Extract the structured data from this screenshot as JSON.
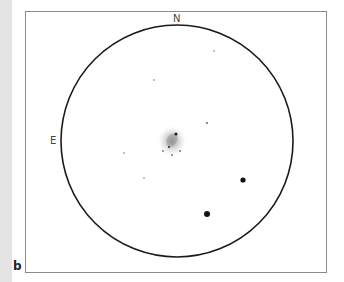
{
  "figure": {
    "panel_label": "b",
    "directions": {
      "north": "N",
      "east": "E"
    },
    "field_of_view": {
      "center_x": 177,
      "center_y": 141,
      "radius": 116,
      "stroke_color": "#1a1a1a"
    },
    "central_object": {
      "type": "nebulous-patch",
      "x": 172,
      "y": 140,
      "color": "#9a9a9a",
      "embedded_stars": [
        {
          "x": 176,
          "y": 134,
          "r": 1.6
        },
        {
          "x": 169,
          "y": 147,
          "r": 1.0
        },
        {
          "x": 163,
          "y": 151,
          "r": 0.8
        },
        {
          "x": 172,
          "y": 155,
          "r": 0.8
        },
        {
          "x": 180,
          "y": 151,
          "r": 0.8
        }
      ]
    },
    "stars": [
      {
        "x": 214,
        "y": 51,
        "r": 0.7,
        "brightness": "faint"
      },
      {
        "x": 154,
        "y": 80,
        "r": 0.7,
        "brightness": "faint"
      },
      {
        "x": 207,
        "y": 123,
        "r": 0.9,
        "brightness": "faint"
      },
      {
        "x": 124,
        "y": 153,
        "r": 0.7,
        "brightness": "faint"
      },
      {
        "x": 144,
        "y": 178,
        "r": 0.7,
        "brightness": "faint"
      },
      {
        "x": 243,
        "y": 180,
        "r": 2.6,
        "brightness": "bright"
      },
      {
        "x": 207,
        "y": 214,
        "r": 3.0,
        "brightness": "bright"
      }
    ]
  }
}
